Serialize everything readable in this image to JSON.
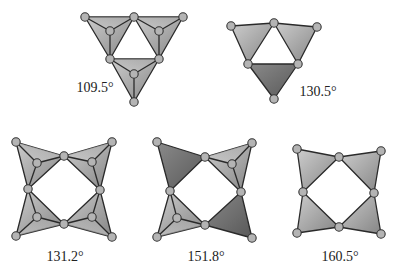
{
  "figure": {
    "panels": [
      {
        "id": "panel-109-5",
        "label": "109.5°",
        "label_pos": [
          95,
          92
        ],
        "triangles": [
          {
            "pts": [
              [
                85,
                17
              ],
              [
                134,
                17
              ],
              [
                110,
                59
              ]
            ],
            "apex": [
              110,
              31
            ],
            "fill": "light"
          },
          {
            "pts": [
              [
                134,
                17
              ],
              [
                183,
                17
              ],
              [
                159,
                59
              ]
            ],
            "apex": [
              159,
              31
            ],
            "fill": "light"
          },
          {
            "pts": [
              [
                110,
                59
              ],
              [
                159,
                59
              ],
              [
                134,
                102
              ]
            ],
            "apex": [
              134,
              74
            ],
            "fill": "light"
          }
        ]
      },
      {
        "id": "panel-130-5",
        "label": "130.5°",
        "label_pos": [
          318,
          96
        ],
        "triangles": [
          {
            "pts": [
              [
                231,
                26
              ],
              [
                274,
                23
              ],
              [
                248,
                64
              ]
            ],
            "apex": null,
            "fill": "light"
          },
          {
            "pts": [
              [
                274,
                23
              ],
              [
                317,
                27
              ],
              [
                298,
                64
              ]
            ],
            "apex": null,
            "fill": "light"
          },
          {
            "pts": [
              [
                248,
                64
              ],
              [
                298,
                64
              ],
              [
                274,
                99
              ]
            ],
            "apex": null,
            "fill": "dark"
          }
        ]
      },
      {
        "id": "panel-131-2",
        "label": "131.2°",
        "label_pos": [
          65,
          261
        ],
        "triangles": [
          {
            "pts": [
              [
                16,
                142
              ],
              [
                64,
                156
              ],
              [
                28,
                189
              ]
            ],
            "apex": [
              37,
              163
            ],
            "fill": "light"
          },
          {
            "pts": [
              [
                112,
                142
              ],
              [
                64,
                156
              ],
              [
                100,
                190
              ]
            ],
            "apex": [
              92,
              162
            ],
            "fill": "light"
          },
          {
            "pts": [
              [
                16,
                236
              ],
              [
                64,
                224
              ],
              [
                28,
                189
              ]
            ],
            "apex": [
              37,
              217
            ],
            "fill": "light"
          },
          {
            "pts": [
              [
                112,
                237
              ],
              [
                64,
                224
              ],
              [
                100,
                190
              ]
            ],
            "apex": [
              92,
              217
            ],
            "fill": "light"
          }
        ]
      },
      {
        "id": "panel-151-8",
        "label": "151.8°",
        "label_pos": [
          206,
          261
        ],
        "triangles": [
          {
            "pts": [
              [
                157,
                142
              ],
              [
                205,
                157
              ],
              [
                170,
                191
              ]
            ],
            "apex": null,
            "fill": "dark"
          },
          {
            "pts": [
              [
                252,
                143
              ],
              [
                205,
                157
              ],
              [
                241,
                192
              ]
            ],
            "apex": [
              232,
              164
            ],
            "fill": "light"
          },
          {
            "pts": [
              [
                157,
                237
              ],
              [
                205,
                225
              ],
              [
                170,
                191
              ]
            ],
            "apex": [
              177,
              218
            ],
            "fill": "light"
          },
          {
            "pts": [
              [
                252,
                238
              ],
              [
                205,
                225
              ],
              [
                241,
                192
              ]
            ],
            "apex": null,
            "fill": "dark"
          }
        ]
      },
      {
        "id": "panel-160-5",
        "label": "160.5°",
        "label_pos": [
          340,
          261
        ],
        "triangles": [
          {
            "pts": [
              [
                297,
                149
              ],
              [
                339,
                157
              ],
              [
                303,
                192
              ]
            ],
            "apex": null,
            "fill": "light"
          },
          {
            "pts": [
              [
                381,
                151
              ],
              [
                339,
                157
              ],
              [
                374,
                193
              ]
            ],
            "apex": null,
            "fill": "light"
          },
          {
            "pts": [
              [
                297,
                233
              ],
              [
                339,
                227
              ],
              [
                303,
                192
              ]
            ],
            "apex": null,
            "fill": "light"
          },
          {
            "pts": [
              [
                381,
                234
              ],
              [
                339,
                227
              ],
              [
                374,
                193
              ]
            ],
            "apex": null,
            "fill": "light"
          }
        ]
      }
    ],
    "colors": {
      "light_top": "#c8c8c8",
      "light_bottom": "#8c8c8c",
      "dark_top": "#8a8a8a",
      "dark_bottom": "#5e5e5e",
      "edge": "#2a2a2a",
      "vertex_fill": "#b4b4b4"
    }
  }
}
